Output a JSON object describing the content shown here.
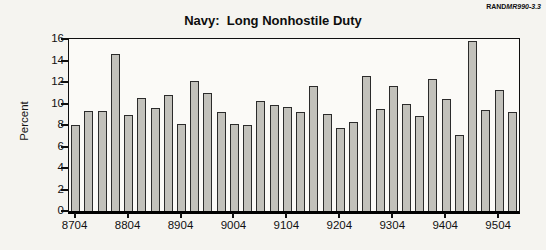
{
  "header": {
    "rand_prefix": "RAND",
    "rand_doc": "MR990-3.3"
  },
  "chart_data": {
    "type": "bar",
    "title": "Navy:  Long Nonhostile Duty",
    "xlabel": "",
    "ylabel": "Percent",
    "ylim": [
      0,
      16
    ],
    "yticks": [
      0,
      2,
      4,
      6,
      8,
      10,
      12,
      14,
      16
    ],
    "grid": false,
    "legend_position": "none",
    "bar_color": "#c2c1bb",
    "bar_border_color": "#2b2b2b",
    "xtick_shown_labels": [
      "8704",
      "8804",
      "8904",
      "9004",
      "9104",
      "9204",
      "9304",
      "9404",
      "9504"
    ],
    "xtick_every": 4,
    "categories": [
      "8704",
      "8707",
      "8710",
      "8801",
      "8804",
      "8807",
      "8810",
      "8901",
      "8904",
      "8907",
      "8910",
      "9001",
      "9004",
      "9007",
      "9010",
      "9101",
      "9104",
      "9107",
      "9110",
      "9201",
      "9204",
      "9207",
      "9210",
      "9301",
      "9304",
      "9307",
      "9310",
      "9401",
      "9404",
      "9407",
      "9410",
      "9501",
      "9504",
      "9507"
    ],
    "values": [
      8.0,
      9.3,
      9.3,
      14.6,
      8.9,
      10.5,
      9.6,
      10.8,
      8.1,
      12.1,
      11.0,
      9.2,
      8.1,
      8.0,
      10.2,
      9.9,
      9.7,
      9.2,
      11.6,
      9.0,
      7.7,
      8.3,
      12.6,
      9.5,
      11.6,
      10.0,
      8.8,
      12.3,
      10.4,
      7.1,
      15.8,
      9.4,
      11.3,
      9.2
    ]
  }
}
